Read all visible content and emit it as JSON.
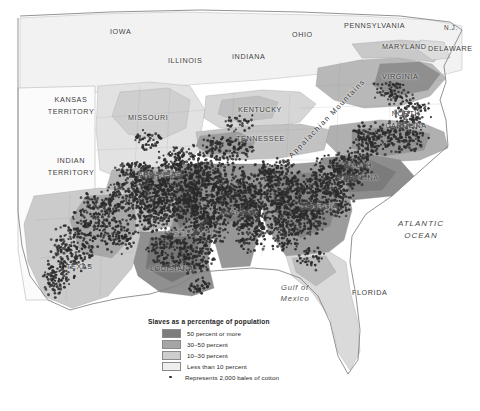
{
  "map": {
    "title": "Slaves as a percentage of population",
    "ocean_labels": {
      "atlantic_line1": "ATLANTIC",
      "atlantic_line2": "OCEAN",
      "gulf_line1": "Gulf of",
      "gulf_line2": "Mexico"
    },
    "physical_features": [
      {
        "name": "Appalachian Mountains",
        "label": "Appalachian Mountains"
      }
    ],
    "places": [
      {
        "name": "iowa",
        "label": "IOWA"
      },
      {
        "name": "illinois",
        "label": "ILLINOIS"
      },
      {
        "name": "indiana",
        "label": "INDIANA"
      },
      {
        "name": "ohio",
        "label": "OHIO"
      },
      {
        "name": "pennsylvania",
        "label": "PENNSYLVANIA"
      },
      {
        "name": "new-jersey",
        "label": "N.J."
      },
      {
        "name": "maryland",
        "label": "MARYLAND"
      },
      {
        "name": "delaware",
        "label": "DELAWARE"
      },
      {
        "name": "virginia",
        "label": "VIRGINIA"
      },
      {
        "name": "kansas-territory",
        "label": "KANSAS\nTERRITORY"
      },
      {
        "name": "indian-territory",
        "label": "INDIAN\nTERRITORY"
      },
      {
        "name": "missouri",
        "label": "MISSOURI"
      },
      {
        "name": "kentucky",
        "label": "KENTUCKY"
      },
      {
        "name": "tennessee",
        "label": "TENNESSEE"
      },
      {
        "name": "north-carolina",
        "label": "NORTH\nCAROLINA"
      },
      {
        "name": "south-carolina",
        "label": "SOUTH\nCAROLINA"
      },
      {
        "name": "arkansas",
        "label": "ARKANSAS"
      },
      {
        "name": "georgia",
        "label": "GEORGIA"
      },
      {
        "name": "alabama",
        "label": "ALABAMA"
      },
      {
        "name": "mississippi",
        "label": "MISSISSIPPI"
      },
      {
        "name": "louisiana",
        "label": "LOUISIANA"
      },
      {
        "name": "texas",
        "label": "TEXAS"
      },
      {
        "name": "florida",
        "label": "FLORIDA"
      }
    ]
  },
  "legend": {
    "title": "Slaves as a percentage of population",
    "classes": [
      {
        "label": "50 percent or more",
        "color": "#7d7d7d"
      },
      {
        "label": "30–50 percent",
        "color": "#a5a5a5"
      },
      {
        "label": "10–30 percent",
        "color": "#cdcdcd"
      },
      {
        "label": "Less than 10 percent",
        "color": "#eeeeee"
      }
    ],
    "dot_entry": {
      "label": "Represents 2,000 bales of cotton",
      "symbol": "cotton-dot",
      "color": "#2b2b2b"
    }
  },
  "chart_data": {
    "type": "map",
    "title": "Slaves as a percentage of population",
    "variable": "Enslaved population share, by county (1860)",
    "legend_position": "bottom-left",
    "classes": [
      {
        "label": "50 percent or more",
        "min": 50,
        "max": 100,
        "color": "#7d7d7d"
      },
      {
        "label": "30–50 percent",
        "min": 30,
        "max": 50,
        "color": "#a5a5a5"
      },
      {
        "label": "10–30 percent",
        "min": 10,
        "max": 30,
        "color": "#cdcdcd"
      },
      {
        "label": "Less than 10 percent",
        "min": 0,
        "max": 10,
        "color": "#eeeeee"
      }
    ],
    "overlay": {
      "type": "dot-density",
      "label": "Represents 2,000 bales of cotton",
      "unit_value": 2000,
      "unit": "bales of cotton",
      "dot_color": "#2b2b2b",
      "concentration_regions": [
        "Mississippi River Valley",
        "Alabama Black Belt",
        "Georgia Piedmont",
        "South Carolina Lowcountry",
        "East Texas",
        "Arkansas Delta"
      ]
    },
    "regions_shown": [
      "IOWA",
      "ILLINOIS",
      "INDIANA",
      "OHIO",
      "PENNSYLVANIA",
      "N.J.",
      "MARYLAND",
      "DELAWARE",
      "VIRGINIA",
      "KANSAS TERRITORY",
      "INDIAN TERRITORY",
      "MISSOURI",
      "KENTUCKY",
      "TENNESSEE",
      "NORTH CAROLINA",
      "SOUTH CAROLINA",
      "ARKANSAS",
      "GEORGIA",
      "ALABAMA",
      "MISSISSIPPI",
      "LOUISIANA",
      "TEXAS",
      "FLORIDA"
    ],
    "water_bodies": [
      "ATLANTIC OCEAN",
      "Gulf of Mexico"
    ],
    "physical_features": [
      "Appalachian Mountains"
    ]
  }
}
